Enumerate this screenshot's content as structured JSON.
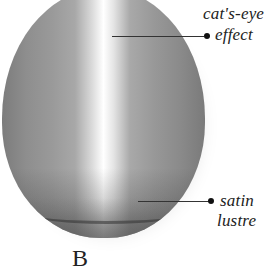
{
  "diagram": {
    "labels": [
      {
        "id": "cats-eye-effect",
        "lines": [
          "cat's-eye",
          "effect"
        ]
      },
      {
        "id": "satin-lustre",
        "lines": [
          "satin",
          "lustre"
        ]
      }
    ],
    "caption_partial": "B"
  },
  "colors": {
    "stone_base": "#8e8e8e",
    "highlight": "#ffffff",
    "text": "#222222"
  }
}
